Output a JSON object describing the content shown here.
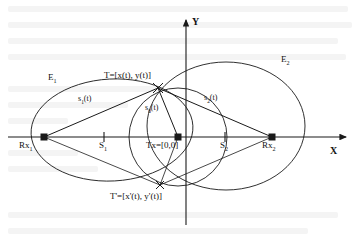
{
  "figure": {
    "type": "geometry-diagram",
    "background": "#ffffff",
    "stroke": "#1a1a1a"
  },
  "axes": {
    "x_label": "X",
    "y_label": "Y",
    "x_axis_y": 137,
    "y_axis_x": 186,
    "x_arrow_tip": 352,
    "y_arrow_tip": 18
  },
  "points": [
    {
      "id": "rx1",
      "label": "Rx",
      "sub": "1",
      "x": 44,
      "y": 137,
      "marker": "square",
      "label_dx": -10,
      "label_dy": 8
    },
    {
      "id": "tx",
      "label": "Tx=[0,0]",
      "sub": "",
      "x": 178,
      "y": 137,
      "marker": "square",
      "label_dx": -30,
      "label_dy": 8
    },
    {
      "id": "rx2",
      "label": "Rx",
      "sub": "2",
      "x": 272,
      "y": 137,
      "marker": "square",
      "label_dx": -10,
      "label_dy": 8
    },
    {
      "id": "target",
      "label": "T=[x(t), y(t)]",
      "sub": "",
      "x": 158,
      "y": 88,
      "marker": "cross",
      "label_dx": -62,
      "label_dy": -14
    },
    {
      "id": "target_mirror",
      "label": "T'=[x'(t), y'(t)]",
      "sub": "",
      "x": 160,
      "y": 185,
      "marker": "cross",
      "label_dx": -50,
      "label_dy": 12
    }
  ],
  "ticks": [
    {
      "id": "s1",
      "label": "S",
      "sub": "1",
      "x": 104,
      "y": 137
    },
    {
      "id": "s2",
      "label": "S",
      "sub": "2",
      "x": 225,
      "y": 137
    }
  ],
  "ellipses": [
    {
      "id": "e1",
      "label": "E",
      "sub": "1",
      "cx": 112,
      "cy": 130,
      "rx": 81,
      "ry": 51,
      "rot": -3,
      "label_x": 50,
      "label_y": 80
    },
    {
      "id": "e2",
      "label": "E",
      "sub": "2",
      "cx": 226,
      "cy": 126,
      "rx": 79,
      "ry": 64,
      "rot": 0,
      "label_x": 282,
      "label_y": 62
    }
  ],
  "circles": [
    {
      "id": "s0-circle",
      "cx": 178,
      "cy": 137,
      "r": 49
    }
  ],
  "segments": [
    {
      "id": "s1-path",
      "label": "s",
      "sub": "1",
      "suffix": "(t)",
      "from": "rx1",
      "to": "target",
      "label_x": 82,
      "label_y": 100
    },
    {
      "id": "s2-path",
      "label": "s",
      "sub": "2",
      "suffix": "(t)",
      "from": "target",
      "to": "rx2",
      "label_x": 208,
      "label_y": 98
    },
    {
      "id": "s0-path",
      "label": "s",
      "sub": "0",
      "suffix": "(t)",
      "from": "tx",
      "to": "target",
      "label_x": 148,
      "label_y": 110
    },
    {
      "id": "s1m-path",
      "label": "",
      "sub": "",
      "suffix": "",
      "from": "rx1",
      "to": "target_mirror",
      "label_x": 0,
      "label_y": 0
    },
    {
      "id": "s2m-path",
      "label": "",
      "sub": "",
      "suffix": "",
      "from": "target_mirror",
      "to": "rx2",
      "label_x": 0,
      "label_y": 0
    }
  ],
  "labels": {
    "e1": "E",
    "e1_sub": "1",
    "e2": "E",
    "e2_sub": "2",
    "s1": "s",
    "s1_sub": "1",
    "s1_suffix": "(t)",
    "s2": "s",
    "s2_sub": "2",
    "s2_suffix": "(t)",
    "s0": "s",
    "s0_sub": "0",
    "s0_suffix": "(t)",
    "rx1": "Rx",
    "rx1_sub": "1",
    "rx2": "Rx",
    "rx2_sub": "2",
    "tx": "Tx=[0,0]",
    "tick_s1": "S",
    "tick_s1_sub": "1",
    "tick_s2": "S",
    "tick_s2_sub": "2",
    "target": "T=[x(t), y(t)]",
    "target_mirror": "T'=[x'(t), y'(t)]",
    "axis_x": "X",
    "axis_y": "Y"
  }
}
